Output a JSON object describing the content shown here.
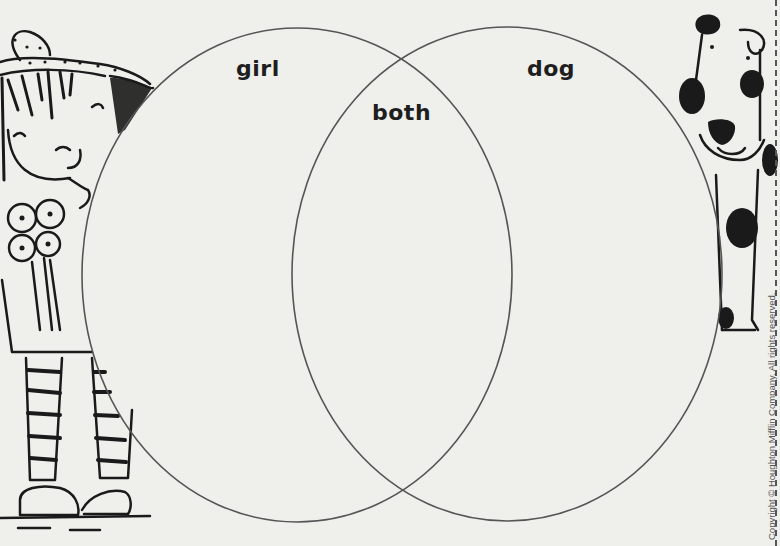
{
  "diagram": {
    "type": "venn",
    "sets": [
      {
        "id": "left",
        "label": "girl"
      },
      {
        "id": "right",
        "label": "dog"
      }
    ],
    "intersection": {
      "label": "both"
    },
    "stroke_color": "#555555",
    "label_color": "#1e1e1e"
  },
  "illustrations": {
    "left": "girl-with-bow-and-flowers",
    "right": "spotted-dog"
  },
  "footer": {
    "copyright": "Copyright © Houghton Mifflin Company. All rights reserved."
  }
}
